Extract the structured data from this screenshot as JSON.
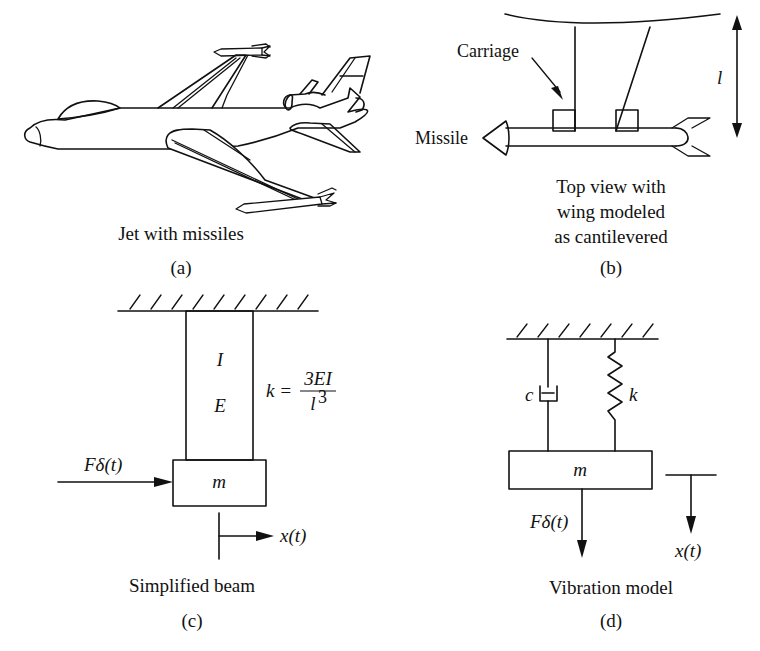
{
  "panels": {
    "a": {
      "caption": "Jet with missiles",
      "tag": "(a)"
    },
    "b": {
      "label_carriage": "Carriage",
      "label_missile": "Missile",
      "label_length": "l",
      "caption_line1": "Top view with",
      "caption_line2": "wing modeled",
      "caption_line3": "as cantilevered",
      "tag": "(b)"
    },
    "c": {
      "label_inertia": "I",
      "label_modulus": "E",
      "stiffness_lhs": "k =",
      "stiffness_num": "3EI",
      "stiffness_den": "l",
      "stiffness_den_exp": "3",
      "label_mass": "m",
      "label_force": "Fδ(t)",
      "label_displacement": "x(t)",
      "caption": "Simplified beam",
      "tag": "(c)"
    },
    "d": {
      "label_damper": "c",
      "label_spring": "k",
      "label_mass": "m",
      "label_force": "Fδ(t)",
      "label_displacement": "x(t)",
      "caption": "Vibration model",
      "tag": "(d)"
    }
  }
}
